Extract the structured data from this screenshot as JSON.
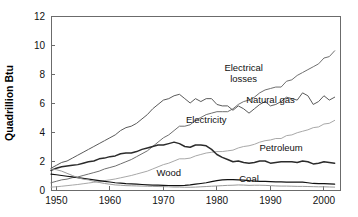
{
  "chart_data": {
    "type": "line",
    "title": "",
    "xlabel": "",
    "ylabel": "Quadrillion Btu",
    "xlim": [
      1949,
      2003
    ],
    "ylim": [
      0,
      12
    ],
    "xticks": [
      1950,
      1960,
      1970,
      1980,
      1990,
      2000
    ],
    "xticklabels": [
      "1950",
      "1960",
      "1970",
      "1980",
      "1990",
      "2000"
    ],
    "yticks": [
      0,
      2,
      4,
      6,
      8,
      10,
      12
    ],
    "yticklabels": [
      "0",
      "2",
      "4",
      "6",
      "8",
      "10",
      "12"
    ],
    "grid": false,
    "legend_position": "inline-labels",
    "x": [
      1949,
      1950,
      1951,
      1952,
      1953,
      1954,
      1955,
      1956,
      1957,
      1958,
      1959,
      1960,
      1961,
      1962,
      1963,
      1964,
      1965,
      1966,
      1967,
      1968,
      1969,
      1970,
      1971,
      1972,
      1973,
      1974,
      1975,
      1976,
      1977,
      1978,
      1979,
      1980,
      1981,
      1982,
      1983,
      1984,
      1985,
      1986,
      1987,
      1988,
      1989,
      1990,
      1991,
      1992,
      1993,
      1994,
      1995,
      1996,
      1997,
      1998,
      1999,
      2000,
      2001,
      2002
    ],
    "series": [
      {
        "name": "Electrical losses",
        "color": "#6f6f6f",
        "width": 1.0,
        "label_x": 1985,
        "label_y": 8.2,
        "values": [
          0.5,
          0.6,
          0.7,
          0.75,
          0.85,
          0.9,
          1.0,
          1.1,
          1.2,
          1.3,
          1.45,
          1.55,
          1.65,
          1.8,
          1.95,
          2.1,
          2.3,
          2.5,
          2.7,
          3.0,
          3.3,
          3.6,
          3.8,
          4.1,
          4.4,
          4.4,
          4.5,
          4.8,
          5.0,
          5.2,
          5.3,
          5.4,
          5.4,
          5.4,
          5.6,
          5.9,
          6.1,
          6.2,
          6.4,
          6.7,
          6.9,
          7.0,
          7.1,
          7.1,
          7.5,
          7.6,
          7.9,
          8.1,
          8.3,
          8.5,
          8.7,
          9.1,
          9.2,
          9.6
        ]
      },
      {
        "name": "Natural gas",
        "color": "#5a5a5a",
        "width": 1.0,
        "label_x": 1990,
        "label_y": 6.0,
        "values": [
          1.5,
          1.7,
          1.9,
          2.0,
          2.2,
          2.4,
          2.6,
          2.8,
          3.0,
          3.2,
          3.4,
          3.6,
          3.8,
          4.1,
          4.3,
          4.4,
          4.6,
          4.9,
          5.2,
          5.6,
          5.9,
          6.2,
          6.3,
          6.5,
          6.6,
          6.3,
          6.0,
          6.3,
          6.1,
          6.3,
          6.3,
          5.9,
          5.8,
          5.8,
          5.5,
          5.8,
          5.6,
          5.3,
          5.6,
          5.9,
          6.1,
          5.8,
          5.9,
          6.1,
          6.4,
          6.3,
          6.2,
          6.7,
          6.5,
          5.9,
          6.1,
          6.5,
          6.2,
          6.4
        ]
      },
      {
        "name": "Electricity",
        "color": "#a8a8a8",
        "width": 1.0,
        "label_x": 1978,
        "label_y": 4.6,
        "values": [
          0.2,
          0.22,
          0.26,
          0.3,
          0.34,
          0.38,
          0.43,
          0.48,
          0.53,
          0.58,
          0.65,
          0.7,
          0.76,
          0.84,
          0.92,
          1.0,
          1.1,
          1.2,
          1.3,
          1.45,
          1.6,
          1.75,
          1.85,
          2.0,
          2.15,
          2.15,
          2.2,
          2.35,
          2.45,
          2.55,
          2.6,
          2.65,
          2.65,
          2.7,
          2.75,
          2.9,
          3.0,
          3.05,
          3.15,
          3.3,
          3.4,
          3.45,
          3.55,
          3.55,
          3.75,
          3.8,
          3.95,
          4.05,
          4.15,
          4.3,
          4.35,
          4.55,
          4.6,
          4.8
        ]
      },
      {
        "name": "Petroleum",
        "color": "#2b2b2b",
        "width": 1.5,
        "label_x": 1992,
        "label_y": 2.7,
        "values": [
          1.35,
          1.5,
          1.6,
          1.65,
          1.7,
          1.75,
          1.85,
          1.95,
          2.0,
          2.15,
          2.2,
          2.3,
          2.35,
          2.5,
          2.55,
          2.55,
          2.65,
          2.8,
          2.9,
          3.0,
          3.1,
          3.1,
          3.2,
          3.3,
          3.2,
          3.0,
          2.95,
          3.1,
          3.1,
          3.05,
          2.8,
          2.45,
          2.25,
          2.1,
          1.95,
          2.0,
          1.9,
          1.85,
          1.9,
          2.0,
          2.0,
          1.85,
          1.9,
          1.95,
          1.95,
          1.95,
          1.9,
          2.0,
          1.95,
          1.8,
          1.85,
          1.95,
          1.9,
          1.85
        ]
      },
      {
        "name": "Wood",
        "color": "#111111",
        "width": 1.2,
        "label_x": 1971,
        "label_y": 0.95,
        "values": [
          1.1,
          1.05,
          1.0,
          0.95,
          0.9,
          0.85,
          0.8,
          0.75,
          0.7,
          0.65,
          0.6,
          0.55,
          0.5,
          0.47,
          0.44,
          0.42,
          0.4,
          0.38,
          0.36,
          0.34,
          0.33,
          0.32,
          0.31,
          0.3,
          0.3,
          0.32,
          0.35,
          0.4,
          0.45,
          0.5,
          0.58,
          0.65,
          0.7,
          0.72,
          0.72,
          0.7,
          0.68,
          0.64,
          0.62,
          0.6,
          0.6,
          0.58,
          0.56,
          0.56,
          0.55,
          0.54,
          0.55,
          0.54,
          0.5,
          0.45,
          0.44,
          0.44,
          0.42,
          0.4
        ]
      },
      {
        "name": "Coal",
        "color": "#9a9a9a",
        "width": 1.0,
        "label_x": 1986,
        "label_y": 0.55,
        "values": [
          1.45,
          1.4,
          1.3,
          1.15,
          1.0,
          0.85,
          0.75,
          0.7,
          0.6,
          0.52,
          0.45,
          0.4,
          0.35,
          0.33,
          0.3,
          0.29,
          0.28,
          0.27,
          0.26,
          0.25,
          0.24,
          0.23,
          0.22,
          0.2,
          0.2,
          0.19,
          0.19,
          0.2,
          0.22,
          0.24,
          0.26,
          0.28,
          0.3,
          0.32,
          0.33,
          0.35,
          0.34,
          0.32,
          0.33,
          0.33,
          0.32,
          0.3,
          0.28,
          0.27,
          0.27,
          0.26,
          0.25,
          0.25,
          0.24,
          0.23,
          0.22,
          0.22,
          0.21,
          0.2
        ]
      }
    ]
  }
}
